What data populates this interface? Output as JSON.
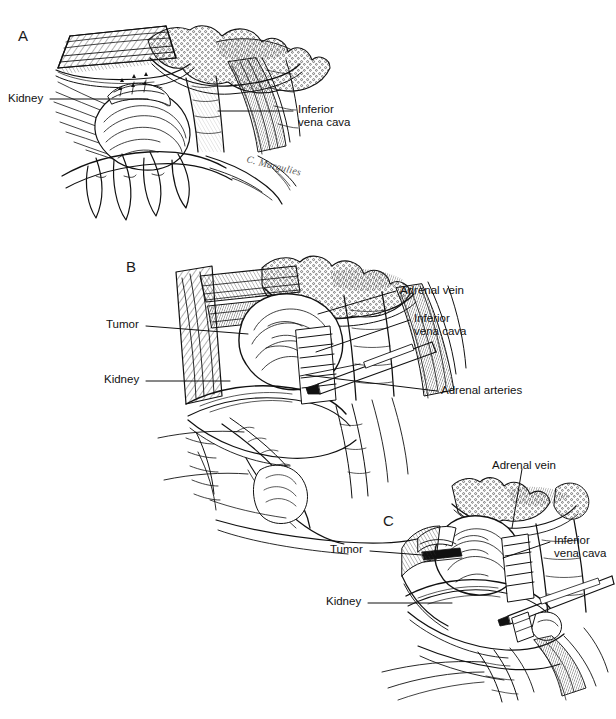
{
  "figure": {
    "kind": "medical-illustration",
    "background_color": "#ffffff",
    "ink_color": "#111111",
    "artist_signature": "C. Margulies"
  },
  "panels": [
    {
      "id": "A",
      "letter": "A",
      "letter_pos": {
        "x": 18,
        "y": 27
      },
      "labels": [
        {
          "name": "kidney",
          "text": "Kidney",
          "side": "left",
          "text_pos": {
            "x": 8,
            "y": 92
          },
          "leader": {
            "x1": 50,
            "y1": 99,
            "x2": 148,
            "y2": 99
          }
        },
        {
          "name": "inferior-vena-cava",
          "text": "Inferior\nvena cava",
          "side": "right",
          "text_pos": {
            "x": 298,
            "y": 103
          },
          "leader": {
            "x1": 293,
            "y1": 111,
            "x2": 218,
            "y2": 111
          }
        }
      ]
    },
    {
      "id": "B",
      "letter": "B",
      "letter_pos": {
        "x": 126,
        "y": 258
      },
      "labels": [
        {
          "name": "tumor",
          "text": "Tumor",
          "side": "left",
          "text_pos": {
            "x": 106,
            "y": 318
          },
          "leader": {
            "x1": 146,
            "y1": 326,
            "x2": 248,
            "y2": 334
          }
        },
        {
          "name": "kidney",
          "text": "Kidney",
          "side": "left",
          "text_pos": {
            "x": 104,
            "y": 373
          },
          "leader": {
            "x1": 146,
            "y1": 381,
            "x2": 230,
            "y2": 381
          }
        },
        {
          "name": "adrenal-vein",
          "text": "Adrenal vein",
          "side": "right",
          "text_pos": {
            "x": 400,
            "y": 284
          },
          "leader": {
            "x1": 396,
            "y1": 291,
            "x2": 318,
            "y2": 314
          }
        },
        {
          "name": "inferior-vena-cava",
          "text": "Inferior\nvena cava",
          "side": "right",
          "text_pos": {
            "x": 414,
            "y": 312
          },
          "leader": {
            "x1": 410,
            "y1": 320,
            "x2": 316,
            "y2": 352
          }
        },
        {
          "name": "adrenal-arteries",
          "text": "Adrenal arteries",
          "side": "right",
          "text_pos": {
            "x": 441,
            "y": 384
          },
          "leader": {
            "x1": 437,
            "y1": 391,
            "x2": 306,
            "y2": 375
          }
        }
      ]
    },
    {
      "id": "C",
      "letter": "C",
      "letter_pos": {
        "x": 383,
        "y": 512
      },
      "labels": [
        {
          "name": "tumor",
          "text": "Tumor",
          "side": "left",
          "text_pos": {
            "x": 330,
            "y": 543
          },
          "leader": {
            "x1": 370,
            "y1": 551,
            "x2": 448,
            "y2": 557
          }
        },
        {
          "name": "kidney",
          "text": "Kidney",
          "side": "left",
          "text_pos": {
            "x": 326,
            "y": 595
          },
          "leader": {
            "x1": 368,
            "y1": 603,
            "x2": 452,
            "y2": 603
          }
        },
        {
          "name": "adrenal-vein",
          "text": "Adrenal vein",
          "side": "right",
          "text_pos": {
            "x": 492,
            "y": 459
          },
          "leader": {
            "x1": 522,
            "y1": 469,
            "x2": 512,
            "y2": 528
          }
        },
        {
          "name": "inferior-vena-cava",
          "text": "Inferior\nvena cava",
          "side": "right",
          "text_pos": {
            "x": 554,
            "y": 534
          },
          "leader": {
            "x1": 550,
            "y1": 542,
            "x2": 503,
            "y2": 558
          }
        }
      ]
    }
  ]
}
